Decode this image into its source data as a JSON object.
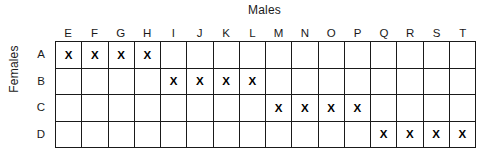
{
  "titles": {
    "x_axis": "Males",
    "y_axis": "Females"
  },
  "chart_data": {
    "type": "table",
    "title": "Males",
    "xlabel": "Males",
    "ylabel": "Females",
    "grid": true,
    "legend": "none",
    "mark_symbol": "X",
    "columns": [
      "E",
      "F",
      "G",
      "H",
      "I",
      "J",
      "K",
      "L",
      "M",
      "N",
      "O",
      "P",
      "Q",
      "R",
      "S",
      "T"
    ],
    "rows": [
      "A",
      "B",
      "C",
      "D"
    ],
    "cells": [
      [
        "X",
        "X",
        "X",
        "X",
        "",
        "",
        "",
        "",
        "",
        "",
        "",
        "",
        "",
        "",
        "",
        ""
      ],
      [
        "",
        "",
        "",
        "",
        "X",
        "X",
        "X",
        "X",
        "",
        "",
        "",
        "",
        "",
        "",
        "",
        ""
      ],
      [
        "",
        "",
        "",
        "",
        "",
        "",
        "",
        "",
        "X",
        "X",
        "X",
        "X",
        "",
        "",
        "",
        ""
      ],
      [
        "",
        "",
        "",
        "",
        "",
        "",
        "",
        "",
        "",
        "",
        "",
        "",
        "X",
        "X",
        "X",
        "X"
      ]
    ],
    "pairings": [
      {
        "female": "A",
        "males": [
          "E",
          "F",
          "G",
          "H"
        ]
      },
      {
        "female": "B",
        "males": [
          "I",
          "J",
          "K",
          "L"
        ]
      },
      {
        "female": "C",
        "males": [
          "M",
          "N",
          "O",
          "P"
        ]
      },
      {
        "female": "D",
        "males": [
          "Q",
          "R",
          "S",
          "T"
        ]
      }
    ],
    "colors": {
      "background": "#ffffff",
      "grid_line": "#1a1a1a",
      "text": "#1a1a1a",
      "mark": "#000000"
    }
  }
}
